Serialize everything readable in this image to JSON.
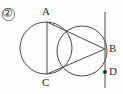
{
  "figure": {
    "item_number": "②",
    "width": 123,
    "height": 94,
    "background_color": "#fefefe",
    "stroke_color": "#4a4a4a",
    "label_color": "#2b2b2b"
  },
  "labels": {
    "point_a": "A",
    "point_b": "B",
    "point_c": "C",
    "point_d": "D"
  },
  "chart_data": {
    "type": "diagram",
    "title": "",
    "subtitle": "",
    "coordinate_system": {
      "origin": "top-left",
      "units": "px",
      "xlim": [
        0,
        123
      ],
      "ylim": [
        0,
        94
      ]
    },
    "circles": [
      {
        "name": "large-circle",
        "cx": 46,
        "cy": 48,
        "r": 26,
        "stroke": "#4a4a4a",
        "fill": "none"
      },
      {
        "name": "small-circle",
        "cx": 82,
        "cy": 51,
        "r": 25,
        "stroke": "#4a4a4a",
        "fill": "none"
      }
    ],
    "points": [
      {
        "label": "A",
        "x": 47,
        "y": 22,
        "marker": "none"
      },
      {
        "label": "B",
        "x": 105,
        "y": 49,
        "marker": "none"
      },
      {
        "label": "C",
        "x": 47,
        "y": 74,
        "marker": "none"
      },
      {
        "label": "D",
        "x": 105,
        "y": 72,
        "marker": "dot"
      }
    ],
    "segments": [
      {
        "name": "chord-AC",
        "x1": 47,
        "y1": 22,
        "x2": 47,
        "y2": 74
      },
      {
        "name": "segment-AB",
        "x1": 47,
        "y1": 22,
        "x2": 105,
        "y2": 49
      },
      {
        "name": "segment-CB",
        "x1": 47,
        "y1": 74,
        "x2": 105,
        "y2": 49
      },
      {
        "name": "tangent-line",
        "x1": 105,
        "y1": 12,
        "x2": 105,
        "y2": 88
      }
    ],
    "grid": false,
    "legend": "none"
  }
}
